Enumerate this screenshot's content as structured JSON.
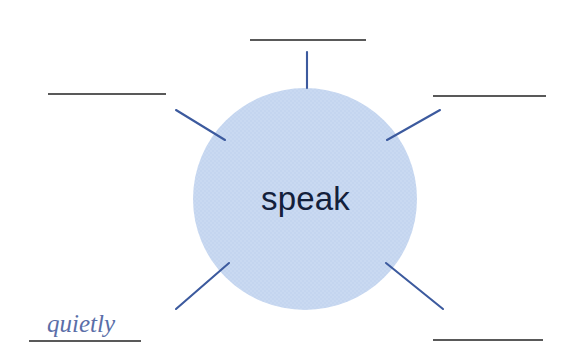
{
  "page": {
    "type": "word-web-worksheet",
    "background_color": "#ffffff",
    "width": 570,
    "height": 361
  },
  "center": {
    "word": "speak",
    "shape": "circle",
    "fill_color": "#c4d5ef",
    "text_color": "#13203b",
    "cx": 305,
    "cy": 199,
    "rx": 112,
    "ry": 111
  },
  "style": {
    "spoke_color": "#3c5a9e",
    "blank_line_color": "#595959",
    "answer_text_color": "#5a6ea8"
  },
  "spokes": [
    {
      "id": "spoke-top",
      "direction": "up",
      "x1": 307,
      "y1": 88,
      "x2": 307,
      "y2": 52
    },
    {
      "id": "spoke-top-left",
      "direction": "upper-left",
      "x1": 225,
      "y1": 140,
      "x2": 176,
      "y2": 110
    },
    {
      "id": "spoke-top-right",
      "direction": "upper-right",
      "x1": 387,
      "y1": 140,
      "x2": 440,
      "y2": 110
    },
    {
      "id": "spoke-bottom-left",
      "direction": "lower-left",
      "x1": 229,
      "y1": 263,
      "x2": 176,
      "y2": 309
    },
    {
      "id": "spoke-bottom-right",
      "direction": "lower-right",
      "x1": 386,
      "y1": 263,
      "x2": 443,
      "y2": 309
    }
  ],
  "blanks": [
    {
      "id": "blank-top",
      "position": "top",
      "answer": "",
      "filled": false,
      "line": {
        "x1": 250,
        "y1": 40,
        "x2": 366,
        "y2": 40
      }
    },
    {
      "id": "blank-top-left",
      "position": "top-left",
      "answer": "",
      "filled": false,
      "line": {
        "x1": 48,
        "y1": 94,
        "x2": 166,
        "y2": 94
      }
    },
    {
      "id": "blank-top-right",
      "position": "top-right",
      "answer": "",
      "filled": false,
      "line": {
        "x1": 433,
        "y1": 96,
        "x2": 546,
        "y2": 96
      }
    },
    {
      "id": "blank-bottom-left",
      "position": "bottom-left",
      "answer": "quietly",
      "filled": true,
      "line": {
        "x1": 29,
        "y1": 341,
        "x2": 141,
        "y2": 341
      }
    },
    {
      "id": "blank-bottom-right",
      "position": "bottom-right",
      "answer": "",
      "filled": false,
      "line": {
        "x1": 433,
        "y1": 340,
        "x2": 543,
        "y2": 340
      }
    }
  ]
}
